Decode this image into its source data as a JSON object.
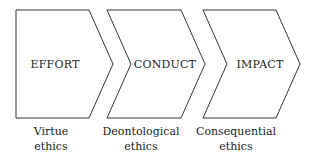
{
  "diagram": {
    "type": "chevron-process",
    "stages": [
      {
        "label": "EFFORT",
        "caption_line1": "Virtue",
        "caption_line2": "ethics"
      },
      {
        "label": "CONDUCT",
        "caption_line1": "Deontological",
        "caption_line2": "ethics"
      },
      {
        "label": "IMPACT",
        "caption_line1": "Consequential",
        "caption_line2": "ethics"
      }
    ],
    "colors": {
      "stroke": "#333333",
      "fill": "#ffffff",
      "text": "#222222"
    }
  }
}
